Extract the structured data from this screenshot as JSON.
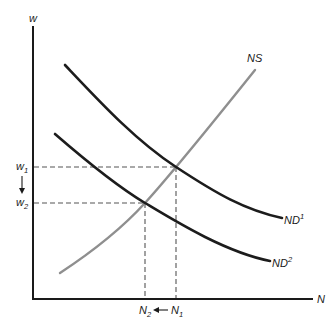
{
  "diagram": {
    "type": "labor-market supply and demand",
    "axes": {
      "y_label": "w",
      "x_label": "N"
    },
    "curves": {
      "supply": {
        "label": "NS",
        "color": "#8f8f8f"
      },
      "demand_initial": {
        "label_base": "ND",
        "label_sup": "1",
        "color": "#1c1c1c"
      },
      "demand_new": {
        "label_base": "ND",
        "label_sup": "2",
        "color": "#1c1c1c"
      }
    },
    "wage_levels": {
      "w1": {
        "base": "w",
        "sub": "1"
      },
      "w2": {
        "base": "w",
        "sub": "2"
      }
    },
    "employment_levels": {
      "n1": {
        "base": "N",
        "sub": "1"
      },
      "n2": {
        "base": "N",
        "sub": "2"
      }
    },
    "shift_annotations": {
      "wage_direction": "down",
      "employment_direction": "left"
    }
  }
}
